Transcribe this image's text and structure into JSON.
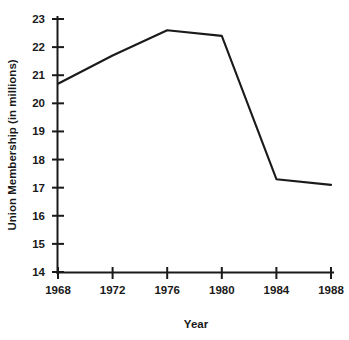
{
  "chart_data": {
    "type": "line",
    "title": "",
    "xlabel": "Year",
    "ylabel": "Union Membership (in millions)",
    "x": [
      1968,
      1972,
      1976,
      1980,
      1984,
      1988
    ],
    "values": [
      20.7,
      21.7,
      22.6,
      22.4,
      17.3,
      17.1
    ],
    "series": [
      {
        "name": "Union Membership",
        "values": [
          20.7,
          21.7,
          22.6,
          22.4,
          17.3,
          17.1
        ]
      }
    ],
    "xlim": [
      1968,
      1988
    ],
    "ylim": [
      14,
      23
    ],
    "x_ticks": [
      "1968",
      "1972",
      "1976",
      "1980",
      "1984",
      "1988"
    ],
    "y_ticks": [
      "14",
      "15",
      "16",
      "17",
      "18",
      "19",
      "20",
      "21",
      "22",
      "23"
    ],
    "grid": false,
    "legend": false,
    "line_color": "#1a1a1a",
    "background_color": "#ffffff"
  },
  "axes": {
    "y_label": "Union Membership (in millions)",
    "x_label": "Year"
  }
}
